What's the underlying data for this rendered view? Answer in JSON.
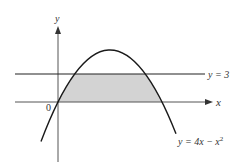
{
  "figure": {
    "axes": {
      "x_label": "x",
      "y_label": "y",
      "origin_label": "0"
    },
    "curves": [
      {
        "name": "parabola",
        "label": "y = 4x − x",
        "label_exponent": "2",
        "equation": "y = 4x - x^2"
      },
      {
        "name": "horizontal-line",
        "label": "y = 3",
        "equation": "y = 3"
      }
    ],
    "shaded_region": {
      "description": "Region between y = 0 and y = 3 bounded by the parabola y = 4x − x^2",
      "fill_color": "#d3d3d3"
    },
    "colors": {
      "curve": "#1a1a1a",
      "axes": "#555555",
      "line": "#222222",
      "shade": "#d3d3d3"
    }
  }
}
